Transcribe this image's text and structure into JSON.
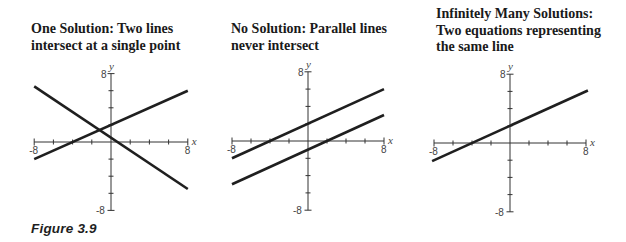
{
  "figure": {
    "caption": "Figure 3.9"
  },
  "panels": [
    {
      "title": "One Solution: Two lines\nintersect at a single point"
    },
    {
      "title": "No Solution: Parallel lines\nnever intersect"
    },
    {
      "title": "Infinitely Many Solutions:\nTwo equations representing\nthe same line"
    }
  ],
  "chart_data": [
    {
      "type": "line",
      "title": "One Solution: Two lines intersect at a single point",
      "xlabel": "x",
      "ylabel": "y",
      "xlim": [
        -8,
        8
      ],
      "ylim": [
        -8,
        8
      ],
      "x_tick_labels": [
        "-8",
        "8"
      ],
      "y_tick_labels": [
        "8",
        "-8"
      ],
      "tick_step": 2,
      "grid": false,
      "series": [
        {
          "name": "line 1",
          "slope": -0.75,
          "intercept": 0.5,
          "x": [
            -8,
            8
          ],
          "y": [
            6.5,
            -5.5
          ]
        },
        {
          "name": "line 2",
          "slope": 0.5,
          "intercept": 2,
          "x": [
            -8,
            8
          ],
          "y": [
            -2,
            6
          ]
        }
      ],
      "layout": {
        "origin": [
          111,
          142
        ],
        "sx": 9.6,
        "sy": 8.55
      }
    },
    {
      "type": "line",
      "title": "No Solution: Parallel lines never intersect",
      "xlabel": "x",
      "ylabel": "y",
      "xlim": [
        -8,
        8
      ],
      "ylim": [
        -8,
        8
      ],
      "x_tick_labels": [
        "-8",
        "8"
      ],
      "y_tick_labels": [
        "8",
        "-8"
      ],
      "tick_step": 2,
      "grid": false,
      "series": [
        {
          "name": "line 1",
          "slope": 0.5,
          "intercept": 2,
          "x": [
            -8,
            8
          ],
          "y": [
            -2,
            6
          ]
        },
        {
          "name": "line 2",
          "slope": 0.5,
          "intercept": -1,
          "x": [
            -8,
            8
          ],
          "y": [
            -5,
            3
          ]
        }
      ],
      "layout": {
        "origin": [
          308,
          141
        ],
        "sx": 9.5,
        "sy": 8.65
      }
    },
    {
      "type": "line",
      "title": "Infinitely Many Solutions: Two equations representing the same line",
      "xlabel": "x",
      "ylabel": "y",
      "xlim": [
        -8,
        8
      ],
      "ylim": [
        -8,
        8
      ],
      "x_tick_labels": [
        "-8",
        "8"
      ],
      "y_tick_labels": [
        "8",
        "-8"
      ],
      "tick_step": 2,
      "grid": false,
      "series": [
        {
          "name": "same line",
          "slope": 0.5,
          "intercept": 2,
          "x": [
            -8.2,
            8.2
          ],
          "y": [
            -2.1,
            6.1
          ]
        }
      ],
      "layout": {
        "origin": [
          510,
          143
        ],
        "sx": 9.5,
        "sy": 8.6
      }
    }
  ]
}
